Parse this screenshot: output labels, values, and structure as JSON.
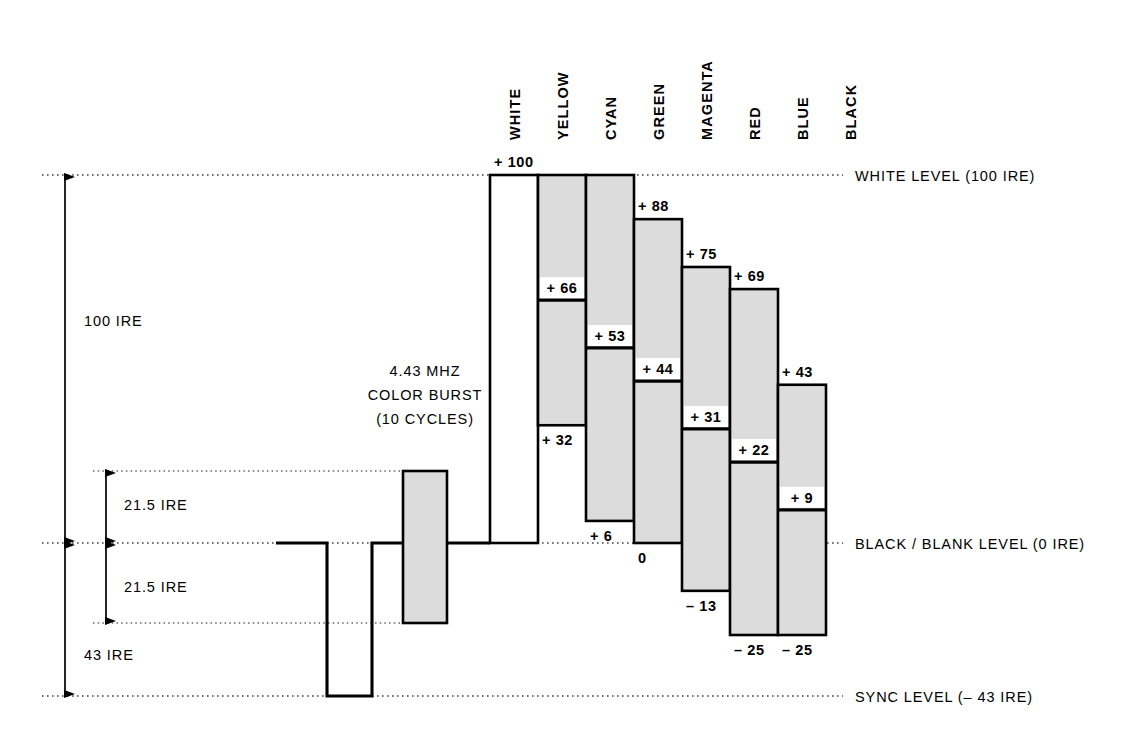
{
  "diagram": {
    "reference_levels": [
      {
        "name": "white-level",
        "label": "WHITE LEVEL (100 IRE)",
        "ire": 100
      },
      {
        "name": "black-level",
        "label": "BLACK / BLANK LEVEL (0 IRE)",
        "ire": 0
      },
      {
        "name": "sync-level",
        "label": "SYNC LEVEL (– 43 IRE)",
        "ire": -43
      }
    ],
    "dimensions": [
      {
        "name": "overall-span",
        "label": "100 IRE"
      },
      {
        "name": "burst-upper",
        "label": "21.5 IRE"
      },
      {
        "name": "burst-lower",
        "label": "21.5 IRE"
      },
      {
        "name": "sync-depth",
        "label": "43 IRE"
      }
    ],
    "burst": {
      "line1": "4.43 MHZ",
      "line2": "COLOR BURST",
      "line3": "(10 CYCLES)",
      "peak_ire": 21.5,
      "trough_ire": -21.5
    },
    "columns": [
      "WHITE",
      "YELLOW",
      "CYAN",
      "GREEN",
      "MAGENTA",
      "RED",
      "BLUE",
      "BLACK"
    ]
  },
  "chart_data": {
    "type": "bar",
    "xlabel": "",
    "ylabel": "IRE",
    "ylim": [
      -43,
      100
    ],
    "grid": false,
    "legend": "none",
    "categories": [
      "WHITE",
      "YELLOW",
      "CYAN",
      "GREEN",
      "MAGENTA",
      "RED",
      "BLUE",
      "BLACK"
    ],
    "series": [
      {
        "name": "peak",
        "values": [
          100,
          100,
          100,
          88,
          75,
          69,
          43,
          0
        ]
      },
      {
        "name": "luminance",
        "values": [
          100,
          66,
          53,
          44,
          31,
          22,
          9,
          0
        ]
      },
      {
        "name": "trough",
        "values": [
          0,
          32,
          6,
          0,
          -13,
          -25,
          -25,
          0
        ]
      }
    ],
    "bars": [
      {
        "name": "WHITE",
        "top_ire": 100,
        "top_label": "+ 100",
        "mid_ire": null,
        "mid_label": "",
        "bottom_ire": 0,
        "bottom_label": "",
        "filled": false
      },
      {
        "name": "YELLOW",
        "top_ire": 100,
        "top_label": "",
        "mid_ire": 66,
        "mid_label": "+ 66",
        "bottom_ire": 32,
        "bottom_label": "+ 32",
        "filled": true
      },
      {
        "name": "CYAN",
        "top_ire": 100,
        "top_label": "",
        "mid_ire": 53,
        "mid_label": "+ 53",
        "bottom_ire": 6,
        "bottom_label": "+ 6",
        "filled": true
      },
      {
        "name": "GREEN",
        "top_ire": 88,
        "top_label": "+ 88",
        "mid_ire": 44,
        "mid_label": "+ 44",
        "bottom_ire": 0,
        "bottom_label": "0",
        "filled": true
      },
      {
        "name": "MAGENTA",
        "top_ire": 75,
        "top_label": "+ 75",
        "mid_ire": 31,
        "mid_label": "+ 31",
        "bottom_ire": -13,
        "bottom_label": "– 13",
        "filled": true
      },
      {
        "name": "RED",
        "top_ire": 69,
        "top_label": "+ 69",
        "mid_ire": 22,
        "mid_label": "+ 22",
        "bottom_ire": -25,
        "bottom_label": "– 25",
        "filled": true
      },
      {
        "name": "BLUE",
        "top_ire": 43,
        "top_label": "+ 43",
        "mid_ire": 9,
        "mid_label": "+ 9",
        "bottom_ire": -25,
        "bottom_label": "– 25",
        "filled": true
      },
      {
        "name": "BLACK",
        "top_ire": 0,
        "top_label": "",
        "mid_ire": null,
        "mid_label": "",
        "bottom_ire": 0,
        "bottom_label": "",
        "filled": false
      }
    ],
    "annotations": [
      "WHITE LEVEL (100 IRE)",
      "BLACK / BLANK LEVEL (0 IRE)",
      "SYNC LEVEL (– 43 IRE)",
      "100 IRE",
      "21.5 IRE",
      "21.5 IRE",
      "43 IRE",
      "4.43 MHZ",
      "COLOR BURST",
      "(10 CYCLES)"
    ],
    "colors": {
      "line": "#000000",
      "fill": "#dcdcdc",
      "background": "#ffffff",
      "dotted": "#555555"
    }
  }
}
